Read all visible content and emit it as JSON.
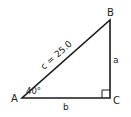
{
  "diagram": {
    "vertices": {
      "A": "A",
      "B": "B",
      "C": "C"
    },
    "sides": {
      "a": "a",
      "b": "b",
      "c": "c = 25.0"
    },
    "angle_A": "40°",
    "colors": {
      "line": "#1a1a1a",
      "background": "#ffffff"
    }
  }
}
